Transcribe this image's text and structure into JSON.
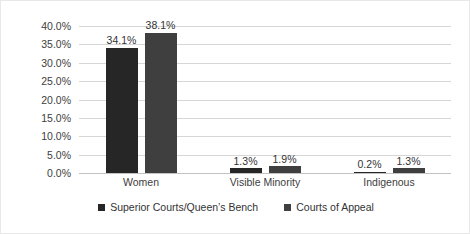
{
  "chart_data": {
    "type": "bar",
    "title": "",
    "subtitle": "",
    "xlabel": "",
    "ylabel": "",
    "categories": [
      "Women",
      "Visible Minority",
      "Indigenous"
    ],
    "series": [
      {
        "name": "Superior Courts/Queen’s Bench",
        "color": "#262626",
        "values": [
          34.1,
          1.3,
          0.2
        ],
        "labels": [
          "34.1%",
          "1.3%",
          "0.2%"
        ]
      },
      {
        "name": "Courts of Appeal",
        "color": "#3f3f3f",
        "values": [
          38.1,
          1.9,
          1.3
        ],
        "labels": [
          "38.1%",
          "1.9%",
          "1.3%"
        ]
      }
    ],
    "ylim": [
      0,
      40
    ],
    "ytick_values": [
      40.0,
      35.0,
      30.0,
      25.0,
      20.0,
      15.0,
      10.0,
      5.0,
      0.0
    ],
    "ytick_labels": [
      "40.0%",
      "35.0%",
      "30.0%",
      "25.0%",
      "20.0%",
      "15.0%",
      "10.0%",
      "5.0%",
      "0.0%"
    ],
    "grid": true,
    "legend_position": "bottom",
    "data_labels": true
  },
  "colors": {
    "series1": "#262626",
    "series2": "#3f3f3f",
    "gridline": "#d6d6d6",
    "axis_text": "#404040",
    "frame": "#e8e8e8",
    "background": "#ffffff"
  }
}
